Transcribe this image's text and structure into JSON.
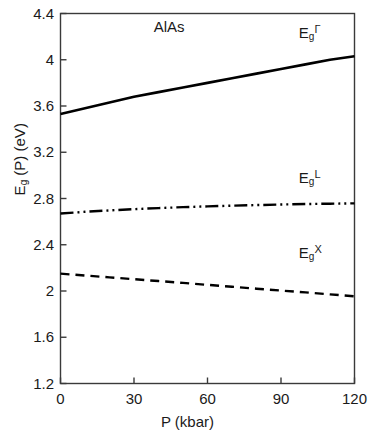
{
  "chart_data": {
    "type": "line",
    "title": "AlAs",
    "xlabel": "P (kbar)",
    "ylabel": "Eg(P) (eV)",
    "ylabel_parts": {
      "base": "E",
      "subscript": "g",
      "rest": "(P) (eV)"
    },
    "xlim": [
      0,
      120
    ],
    "ylim": [
      1.2,
      4.4
    ],
    "grid": false,
    "legend_position": "inline-right",
    "xticks": [
      "0",
      "30",
      "60",
      "90",
      "120"
    ],
    "xtick_values": [
      0,
      30,
      60,
      90,
      120
    ],
    "yticks": [
      "1.2",
      "1.6",
      "2",
      "2.4",
      "2.8",
      "3.2",
      "3.6",
      "4",
      "4.4"
    ],
    "ytick_values": [
      1.2,
      1.6,
      2.0,
      2.4,
      2.8,
      3.2,
      3.6,
      4.0,
      4.4
    ],
    "x": [
      0,
      10,
      20,
      30,
      40,
      50,
      60,
      70,
      80,
      90,
      100,
      110,
      120
    ],
    "series": [
      {
        "name": "Eg-Gamma",
        "label_base": "E",
        "label_sub": "g",
        "label_sup": "Γ",
        "linestyle": "solid",
        "color": "#000000",
        "width": 2.6,
        "values": [
          3.53,
          3.58,
          3.63,
          3.68,
          3.72,
          3.76,
          3.8,
          3.84,
          3.88,
          3.92,
          3.96,
          4.0,
          4.03
        ]
      },
      {
        "name": "Eg-L",
        "label_base": "E",
        "label_sub": "g",
        "label_sup": "L",
        "linestyle": "dashdotdot",
        "color": "#000000",
        "width": 2.4,
        "values": [
          2.67,
          2.685,
          2.697,
          2.708,
          2.717,
          2.725,
          2.732,
          2.738,
          2.743,
          2.748,
          2.752,
          2.755,
          2.758
        ]
      },
      {
        "name": "Eg-X",
        "label_base": "E",
        "label_sub": "g",
        "label_sup": "X",
        "linestyle": "dashed",
        "color": "#000000",
        "width": 2.4,
        "values": [
          2.15,
          2.134,
          2.118,
          2.102,
          2.086,
          2.07,
          2.053,
          2.037,
          2.02,
          2.004,
          1.988,
          1.971,
          1.954
        ]
      }
    ],
    "annotations": [
      {
        "text": "AlAs",
        "x": 47,
        "y": 4.28
      },
      {
        "text": "Eg-Gamma-label",
        "x": 103,
        "y": 4.23
      },
      {
        "text": "Eg-L-label",
        "x": 103,
        "y": 2.98
      },
      {
        "text": "Eg-X-label",
        "x": 103,
        "y": 2.33
      }
    ]
  }
}
